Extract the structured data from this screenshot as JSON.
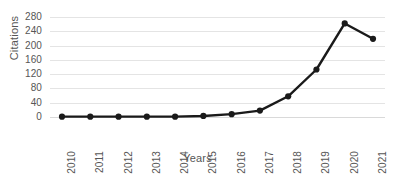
{
  "chart_data": {
    "type": "line",
    "title": "",
    "xlabel": "Years",
    "ylabel": "Citations",
    "categories": [
      "≤2010",
      "2011",
      "2012",
      "2013",
      "2014",
      "2015",
      "2016",
      "2017",
      "2018",
      "2019",
      "2020",
      "2021"
    ],
    "values": [
      1,
      1,
      1,
      1,
      1,
      3,
      8,
      18,
      58,
      133,
      262,
      219
    ],
    "series": [
      {
        "name": "Citations",
        "values": [
          1,
          1,
          1,
          1,
          1,
          3,
          8,
          18,
          58,
          133,
          262,
          219
        ]
      }
    ],
    "ylim": [
      0,
      280
    ],
    "yticks": [
      0,
      40,
      80,
      120,
      160,
      200,
      240,
      280
    ],
    "ytick_labels": [
      "0",
      "40",
      "80",
      "120",
      "160",
      "200",
      "240",
      "280"
    ],
    "grid": true,
    "grid_axis": "y",
    "legend": false,
    "legend_position": "none",
    "marker": "circle",
    "line_color": "#1a1a1a",
    "marker_color": "#1a1a1a",
    "grid_color": "#e4e4e4",
    "text_color": "#565656",
    "background": "#ffffff"
  }
}
